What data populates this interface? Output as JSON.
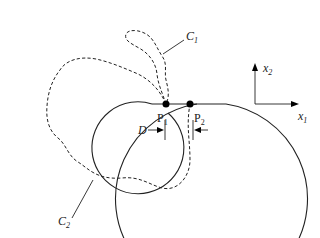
{
  "figure": {
    "type": "domain-geometry-diagram",
    "colors": {
      "stroke": "#222222",
      "background": "#ffffff",
      "point": "#000000"
    },
    "curves": [
      {
        "id": "C1",
        "label": "C",
        "subscript": "1",
        "style": "dashed"
      },
      {
        "id": "C2",
        "label": "C",
        "subscript": "2",
        "style": "dashed"
      }
    ],
    "points": [
      {
        "id": "P1",
        "label": "P",
        "subscript": "1"
      },
      {
        "id": "P2",
        "label": "P",
        "subscript": "2"
      }
    ],
    "dimension": {
      "label": "D"
    },
    "axes": {
      "x": {
        "label": "x",
        "subscript": "1"
      },
      "y": {
        "label": "x",
        "subscript": "2"
      }
    }
  }
}
